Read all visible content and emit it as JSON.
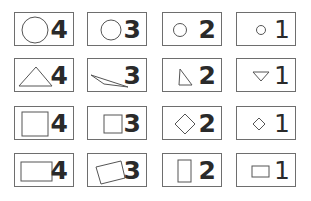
{
  "grid": {
    "rows": [
      {
        "shape": "circle",
        "cards": [
          {
            "icon": "circle-large-icon",
            "number": "4"
          },
          {
            "icon": "circle-medium-icon",
            "number": "3"
          },
          {
            "icon": "circle-small-icon",
            "number": "2"
          },
          {
            "icon": "circle-tiny-icon",
            "number": "1"
          }
        ]
      },
      {
        "shape": "triangle",
        "cards": [
          {
            "icon": "triangle-large-icon",
            "number": "4"
          },
          {
            "icon": "triangle-skewed-icon",
            "number": "3"
          },
          {
            "icon": "triangle-small-icon",
            "number": "2"
          },
          {
            "icon": "triangle-inverted-icon",
            "number": "1"
          }
        ]
      },
      {
        "shape": "square",
        "cards": [
          {
            "icon": "square-large-icon",
            "number": "4"
          },
          {
            "icon": "square-medium-icon",
            "number": "3"
          },
          {
            "icon": "diamond-medium-icon",
            "number": "2"
          },
          {
            "icon": "diamond-small-icon",
            "number": "1"
          }
        ]
      },
      {
        "shape": "rectangle",
        "cards": [
          {
            "icon": "rectangle-large-icon",
            "number": "4"
          },
          {
            "icon": "rectangle-tilted-icon",
            "number": "3"
          },
          {
            "icon": "rectangle-vertical-icon",
            "number": "2"
          },
          {
            "icon": "rectangle-small-icon",
            "number": "1"
          }
        ]
      }
    ]
  }
}
